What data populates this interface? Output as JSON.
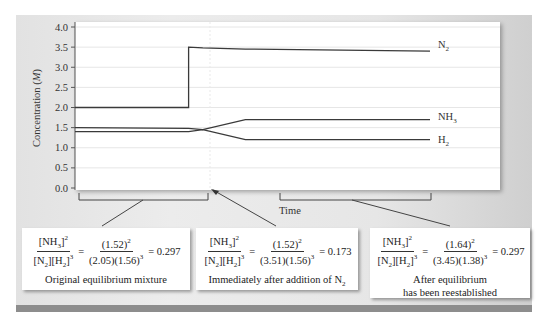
{
  "chart_data": {
    "type": "line",
    "title": "",
    "xlabel": "Time",
    "ylabel": "Concentration (M)",
    "ylim": [
      0.0,
      4.0
    ],
    "yticks": [
      "0.0",
      "0.5",
      "1.0",
      "1.5",
      "2.0",
      "2.5",
      "3.0",
      "3.5",
      "4.0"
    ],
    "grid": true,
    "x": [
      0,
      0.32,
      0.32,
      0.36,
      0.48,
      0.49,
      1.0
    ],
    "series": [
      {
        "name": "N2",
        "label": "N₂",
        "values": [
          2.0,
          2.0,
          3.5,
          3.48,
          3.45,
          3.45,
          3.4
        ]
      },
      {
        "name": "NH3",
        "label": "NH₃",
        "values": [
          1.5,
          1.48,
          1.48,
          1.45,
          1.7,
          1.7,
          1.7
        ]
      },
      {
        "name": "H2",
        "label": "H₂",
        "values": [
          1.4,
          1.4,
          1.4,
          1.45,
          1.2,
          1.2,
          1.2
        ]
      }
    ],
    "annotations": [
      {
        "region": "Original equilibrium mixture",
        "nh3": "1.52",
        "n2": "2.05",
        "h2": "1.56",
        "q": "0.297"
      },
      {
        "region": "Immediately after addition of N2",
        "nh3": "1.52",
        "n2": "3.51",
        "h2": "1.56",
        "q": "0.173"
      },
      {
        "region": "After equilibrium has been reestablished",
        "nh3": "1.64",
        "n2": "3.45",
        "h2": "1.38",
        "q": "0.297"
      }
    ]
  },
  "axis": {
    "ylabel": "Concentration (M)",
    "xlabel": "Time",
    "yticks": [
      "0.0",
      "0.5",
      "1.0",
      "1.5",
      "2.0",
      "2.5",
      "3.0",
      "3.5",
      "4.0"
    ]
  },
  "legend": {
    "n2": "N",
    "n2_sub": "2",
    "nh3": "NH",
    "nh3_sub": "3",
    "h2": "H",
    "h2_sub": "2"
  },
  "boxes": [
    {
      "lhs_num": "[NH",
      "lhs_num_sub": "3",
      "lhs_num_sup": "2",
      "lhs_den_a": "[N",
      "lhs_den_a_sub": "2",
      "lhs_den_b": "][H",
      "lhs_den_b_sub": "2",
      "lhs_den_sup": "3",
      "rhs_num": "(1.52)",
      "rhs_num_sup": "2",
      "rhs_den": "(2.05)(1.56)",
      "rhs_den_sup": "3",
      "result": "= 0.297",
      "eq": "=",
      "caption1": "Original equilibrium mixture",
      "caption2": ""
    },
    {
      "lhs_num": "[NH",
      "lhs_num_sub": "3",
      "lhs_num_sup": "2",
      "lhs_den_a": "[N",
      "lhs_den_a_sub": "2",
      "lhs_den_b": "][H",
      "lhs_den_b_sub": "2",
      "lhs_den_sup": "3",
      "rhs_num": "(1.52)",
      "rhs_num_sup": "2",
      "rhs_den": "(3.51)(1.56)",
      "rhs_den_sup": "3",
      "result": "= 0.173",
      "eq": "=",
      "caption1": "Immediately after addition of N",
      "caption1_sub": "2",
      "caption2": ""
    },
    {
      "lhs_num": "[NH",
      "lhs_num_sub": "3",
      "lhs_num_sup": "2",
      "lhs_den_a": "[N",
      "lhs_den_a_sub": "2",
      "lhs_den_b": "][H",
      "lhs_den_b_sub": "2",
      "lhs_den_sup": "3",
      "rhs_num": "(1.64)",
      "rhs_num_sup": "2",
      "rhs_den": "(3.45)(1.38)",
      "rhs_den_sup": "3",
      "result": "= 0.297",
      "eq": "=",
      "caption1": "After equilibrium",
      "caption2": "has been reestablished"
    }
  ],
  "colors": {
    "line": "#3a3a3a",
    "grid": "#e6e6e6",
    "plot_bg": "#ffffff",
    "panel_bg": "#e6e6e6",
    "stripe": "#8d8d8d"
  }
}
